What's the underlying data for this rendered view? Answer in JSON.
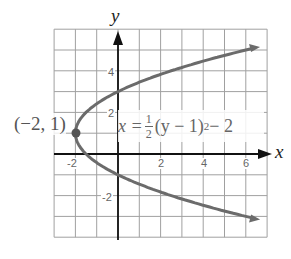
{
  "figure": {
    "marker": "•",
    "axes": {
      "x_label": "x",
      "y_label": "y"
    },
    "x_ticks": [
      "-2",
      "2",
      "4",
      "6"
    ],
    "y_ticks": [
      "4",
      "2",
      "-2"
    ],
    "vertex_label": "(−2, 1)",
    "equation": {
      "lhs": "x = ",
      "frac_num": "1",
      "frac_den": "2",
      "rhs_base": "(y − 1)",
      "rhs_exp": "2",
      "rhs_tail": " − 2"
    },
    "colors": {
      "grid": "#9a9a9a",
      "axis": "#111111",
      "curve": "#6b6b6b",
      "text": "#555555"
    }
  },
  "chart_data": {
    "type": "line",
    "title": "",
    "equation": "x = 1/2 (y - 1)^2 - 2",
    "xlabel": "x",
    "ylabel": "y",
    "xlim": [
      -3,
      7
    ],
    "ylim": [
      -4,
      6
    ],
    "grid": true,
    "x_tick_labels": [
      -2,
      2,
      4,
      6
    ],
    "y_tick_labels": [
      4,
      2,
      -2
    ],
    "vertex": {
      "x": -2,
      "y": 1,
      "label": "(-2, 1)"
    },
    "series": [
      {
        "name": "x = 1/2 (y - 1)^2 - 2",
        "points": [
          {
            "x": 7.0,
            "y": -3.24
          },
          {
            "x": 6.0,
            "y": -3.0
          },
          {
            "x": 2.5,
            "y": -2.0
          },
          {
            "x": 0.0,
            "y": -1.0
          },
          {
            "x": -1.5,
            "y": 0.0
          },
          {
            "x": -2.0,
            "y": 1.0
          },
          {
            "x": -1.5,
            "y": 2.0
          },
          {
            "x": 0.0,
            "y": 3.0
          },
          {
            "x": 2.5,
            "y": 4.0
          },
          {
            "x": 6.0,
            "y": 5.0
          },
          {
            "x": 7.0,
            "y": 5.24
          }
        ]
      }
    ]
  }
}
